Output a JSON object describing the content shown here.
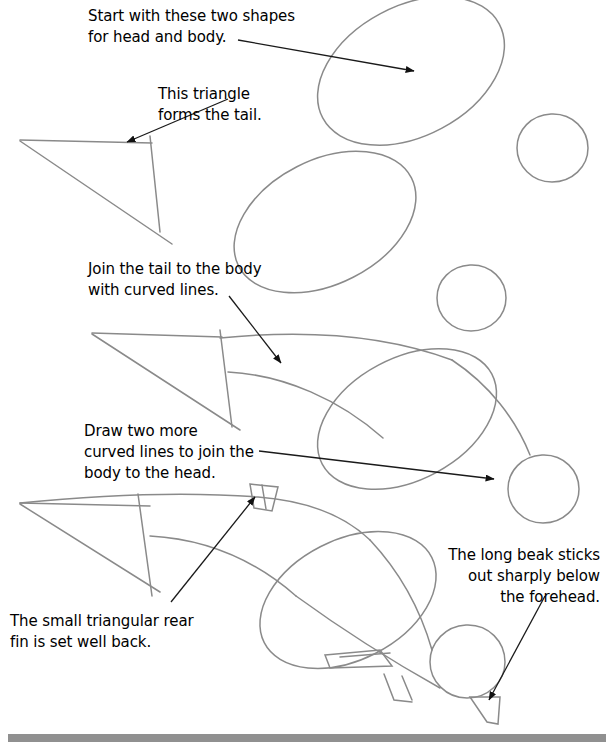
{
  "page": {
    "background_color": "#ffffff",
    "pencil_color": "#8a8a8a",
    "ink_color": "#1a1a1a",
    "bottom_bar_color": "#909090"
  },
  "captions": {
    "start": "Start with these two shapes\nfor head and body.",
    "triangle": "This triangle\nforms the tail.",
    "join": "Join the tail to the body\nwith curved lines.",
    "two_more": "Draw two more\ncurved lines to join the\nbody to the head.",
    "fin": "The small triangular rear\nfin is set well back.",
    "beak": "The long beak sticks\nout sharply below\nthe forehead."
  },
  "steps": [
    {
      "index": 1,
      "name": "step-1-basic-shapes",
      "description": "Large tilted ellipse for the body and a small circle for the head, plus a triangle for the tail.",
      "caption_keys": [
        "start",
        "triangle"
      ]
    },
    {
      "index": 2,
      "name": "step-2-second-shapes",
      "description": "A second tilted body ellipse with a head circle below and to the right.",
      "caption_keys": []
    },
    {
      "index": 3,
      "name": "step-3-join-tail",
      "description": "Tail triangle joined to the body ellipse with two curved lines.",
      "caption_keys": [
        "join"
      ]
    },
    {
      "index": 4,
      "name": "step-4-join-head-and-beak",
      "description": "Curved lines joining body to head, a small triangular rear fin, legs and a long beak below the forehead.",
      "caption_keys": [
        "two_more",
        "fin",
        "beak"
      ]
    }
  ],
  "arrows": [
    {
      "name": "arrow-to-body-ellipse",
      "from": [
        238,
        40
      ],
      "to": [
        414,
        71
      ]
    },
    {
      "name": "arrow-to-tail-triangle",
      "from": [
        228,
        99
      ],
      "to": [
        127,
        142
      ]
    },
    {
      "name": "arrow-to-curved-join",
      "from": [
        229,
        296
      ],
      "to": [
        281,
        363
      ]
    },
    {
      "name": "arrow-to-head-join",
      "from": [
        259,
        451
      ],
      "to": [
        494,
        479
      ]
    },
    {
      "name": "arrow-to-rear-fin",
      "from": [
        171,
        602
      ],
      "to": [
        255,
        497
      ]
    },
    {
      "name": "arrow-to-beak",
      "from": [
        545,
        596
      ],
      "to": [
        489,
        700
      ]
    }
  ]
}
